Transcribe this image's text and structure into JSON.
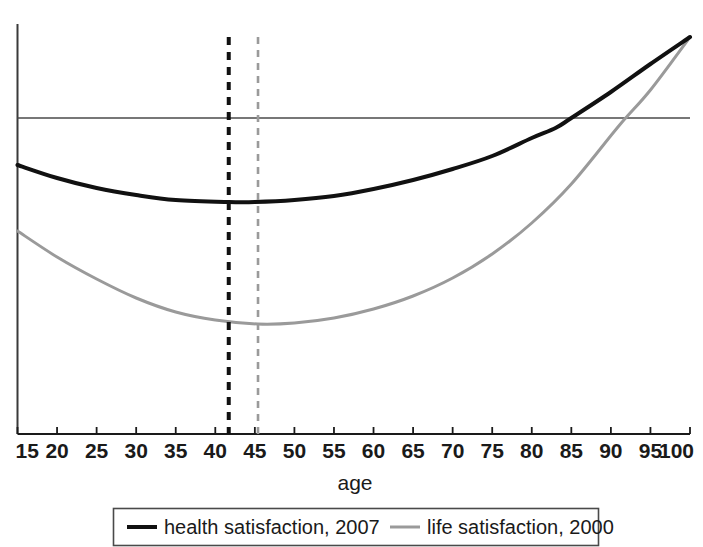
{
  "chart_data": {
    "type": "line",
    "title": "",
    "subtitle": "",
    "xlabel": "age",
    "ylabel": "",
    "xlim": [
      15,
      100
    ],
    "ylim": [
      0,
      1
    ],
    "grid": false,
    "legend_position": "bottom",
    "xticks": [
      "15",
      "20",
      "25",
      "30",
      "35",
      "40",
      "45",
      "50",
      "55",
      "60",
      "65",
      "70",
      "75",
      "80",
      "85",
      "90",
      "95",
      "100"
    ],
    "xtick_values": [
      15,
      20,
      25,
      30,
      35,
      40,
      45,
      50,
      55,
      60,
      65,
      70,
      75,
      80,
      85,
      90,
      95,
      100
    ],
    "yticks": [],
    "annotations": [
      {
        "name": "black-minimum-dropline",
        "style": "dashed",
        "color": "#111111",
        "x": 41.7,
        "label": ""
      },
      {
        "name": "gray-minimum-dropline",
        "style": "dashed",
        "color": "#9a9a9a",
        "x": 45.4,
        "label": ""
      },
      {
        "name": "horizontal-reference-line",
        "style": "solid",
        "color": "#555555",
        "y_pixel": 118,
        "label": ""
      }
    ],
    "series": [
      {
        "name": "health satisfaction, 2007",
        "color": "#111111",
        "linewidth": 4,
        "minimum_age": 41.7,
        "x": [
          15,
          20,
          25,
          30,
          35,
          41.7,
          45,
          50,
          55,
          60,
          65,
          70,
          75,
          80,
          83,
          85,
          90,
          95,
          100
        ],
        "y_pixel": [
          165,
          178,
          188,
          195,
          200,
          202,
          202,
          200,
          196,
          189,
          180,
          169,
          156,
          138,
          128,
          118,
          92,
          64,
          37
        ]
      },
      {
        "name": "life satisfaction, 2000",
        "color": "#9a9a9a",
        "linewidth": 3,
        "minimum_age": 45.4,
        "x": [
          15,
          20,
          25,
          30,
          35,
          40,
          45.4,
          50,
          55,
          60,
          65,
          70,
          75,
          80,
          85,
          91,
          95,
          100
        ],
        "y_pixel": [
          231,
          257,
          279,
          298,
          312,
          320,
          324,
          323,
          318,
          309,
          296,
          278,
          254,
          223,
          184,
          126,
          90,
          37
        ]
      }
    ]
  },
  "axes": {
    "x_axis_label": "age"
  },
  "legend": {
    "items": [
      {
        "label": "health satisfaction, 2007",
        "color": "#111111"
      },
      {
        "label": "life satisfaction, 2000",
        "color": "#9a9a9a"
      }
    ]
  }
}
